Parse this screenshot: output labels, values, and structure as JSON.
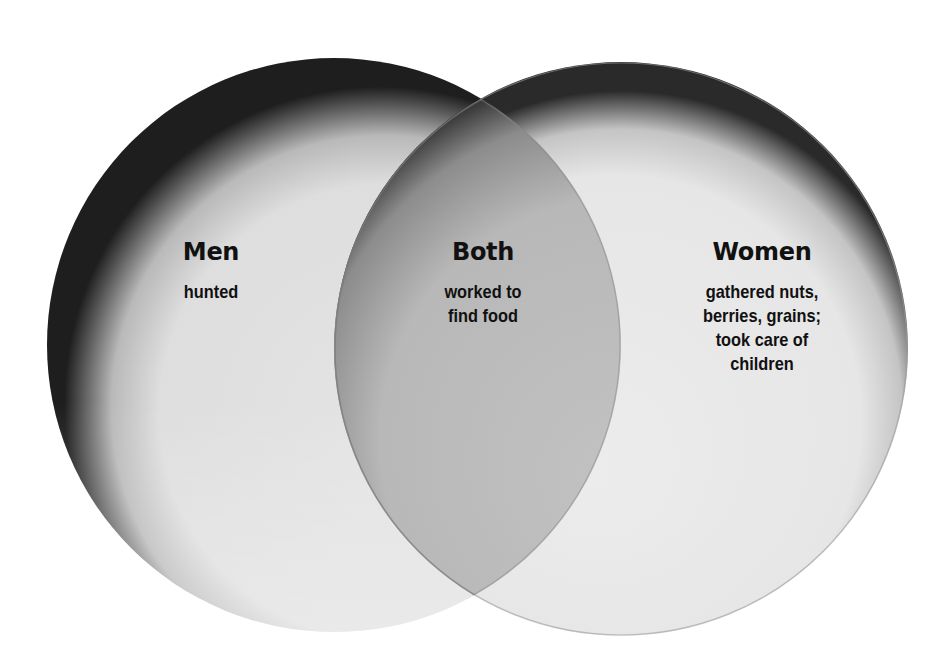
{
  "diagram": {
    "type": "venn",
    "sets": [
      {
        "id": "men",
        "title": "Men",
        "description_lines": [
          "hunted"
        ]
      },
      {
        "id": "both",
        "title": "Both",
        "description_lines": [
          "worked to",
          "find food"
        ]
      },
      {
        "id": "women",
        "title": "Women",
        "description_lines": [
          "gathered nuts,",
          "berries, grains;",
          "took care of",
          "children"
        ]
      }
    ],
    "colors": {
      "circle_fill": "#e6e6e6",
      "overlap_fill": "#bdbdbd",
      "rim_dark": "#1a1a1a",
      "text": "#111111",
      "background": "#ffffff"
    }
  }
}
